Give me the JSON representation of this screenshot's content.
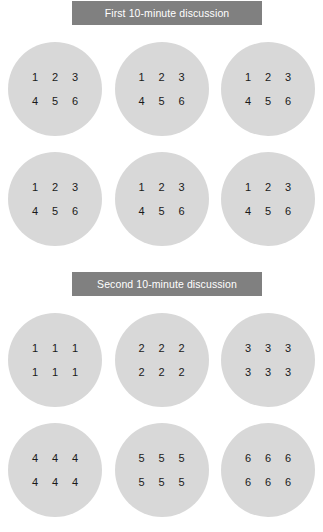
{
  "sections": [
    {
      "id": "first-discussion",
      "header": "First 10-minute discussion",
      "header_color": "#808080",
      "header_text_color": "#ffffff",
      "circle_color": "#d8d8d8",
      "rows": [
        {
          "circles": [
            {
              "cells": [
                "1",
                "2",
                "3",
                "4",
                "5",
                "6"
              ]
            },
            {
              "cells": [
                "1",
                "2",
                "3",
                "4",
                "5",
                "6"
              ]
            },
            {
              "cells": [
                "1",
                "2",
                "3",
                "4",
                "5",
                "6"
              ]
            }
          ]
        },
        {
          "circles": [
            {
              "cells": [
                "1",
                "2",
                "3",
                "4",
                "5",
                "6"
              ]
            },
            {
              "cells": [
                "1",
                "2",
                "3",
                "4",
                "5",
                "6"
              ]
            },
            {
              "cells": [
                "1",
                "2",
                "3",
                "4",
                "5",
                "6"
              ]
            }
          ]
        }
      ]
    },
    {
      "id": "second-discussion",
      "header": "Second 10-minute discussion",
      "header_color": "#808080",
      "header_text_color": "#ffffff",
      "circle_color": "#d8d8d8",
      "rows": [
        {
          "circles": [
            {
              "cells": [
                "1",
                "1",
                "1",
                "1",
                "1",
                "1"
              ]
            },
            {
              "cells": [
                "2",
                "2",
                "2",
                "2",
                "2",
                "2"
              ]
            },
            {
              "cells": [
                "3",
                "3",
                "3",
                "3",
                "3",
                "3"
              ]
            }
          ]
        },
        {
          "circles": [
            {
              "cells": [
                "4",
                "4",
                "4",
                "4",
                "4",
                "4"
              ]
            },
            {
              "cells": [
                "5",
                "5",
                "5",
                "5",
                "5",
                "5"
              ]
            },
            {
              "cells": [
                "6",
                "6",
                "6",
                "6",
                "6",
                "6"
              ]
            }
          ]
        }
      ]
    }
  ]
}
